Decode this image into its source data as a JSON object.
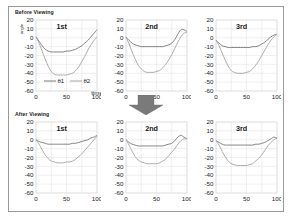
{
  "figure": {
    "sections": [
      {
        "title": "Before Viewing"
      },
      {
        "title": "After Viewing"
      }
    ],
    "arrow": {
      "name": "down-arrow",
      "color": "#7a7a7a"
    }
  },
  "axis": {
    "y_ticks": [
      "20",
      "10",
      "0",
      "-10",
      "-20",
      "-30",
      "-40",
      "-50",
      "-60"
    ],
    "x_ticks": [
      "0",
      "50",
      "100"
    ],
    "x_label": "time",
    "y_label": "angle",
    "ylim": [
      -60,
      20
    ],
    "xlim": [
      0,
      100
    ]
  },
  "legend": {
    "entries": [
      {
        "label": "θ1",
        "color": "#6e6e6e"
      },
      {
        "label": "θ2",
        "color": "#9d9d9d"
      }
    ]
  },
  "chart_data": {
    "type": "line",
    "xlabel": "time",
    "ylabel": "angle",
    "xlim": [
      0,
      100
    ],
    "ylim": [
      -60,
      20
    ],
    "grid": true,
    "legend_position": "inside-bottom-left (first panel only)",
    "y_ticks": [
      20,
      10,
      0,
      -10,
      -20,
      -30,
      -40,
      -50,
      -60
    ],
    "x_ticks": [
      0,
      50,
      100
    ],
    "panels": [
      {
        "row": "Before Viewing",
        "title": "1st",
        "x": [
          0,
          5,
          10,
          15,
          20,
          25,
          30,
          35,
          40,
          45,
          50,
          55,
          60,
          65,
          70,
          75,
          80,
          85,
          90,
          95,
          100
        ],
        "series": [
          {
            "name": "θ1",
            "values": [
              1,
              -4,
              -9,
              -13,
              -15,
              -16,
              -16,
              -16,
              -16,
              -16,
              -15,
              -15,
              -14,
              -13,
              -11,
              -9,
              -6,
              -3,
              1,
              5,
              9
            ]
          },
          {
            "name": "θ2",
            "values": [
              1,
              -6,
              -15,
              -24,
              -32,
              -38,
              -41,
              -42,
              -42,
              -42,
              -42,
              -41,
              -40,
              -37,
              -33,
              -27,
              -21,
              -14,
              -8,
              -3,
              1
            ]
          }
        ]
      },
      {
        "row": "Before Viewing",
        "title": "2nd",
        "x": [
          0,
          5,
          10,
          15,
          20,
          25,
          30,
          35,
          40,
          45,
          50,
          55,
          60,
          65,
          70,
          75,
          80,
          85,
          90,
          95,
          100
        ],
        "series": [
          {
            "name": "θ1",
            "values": [
              1,
              -3,
              -6,
              -8,
              -9,
              -10,
              -10,
              -10,
              -10,
              -10,
              -10,
              -10,
              -10,
              -9,
              -8,
              -6,
              -2,
              4,
              9,
              9,
              7
            ]
          },
          {
            "name": "θ2",
            "values": [
              1,
              -7,
              -16,
              -24,
              -31,
              -35,
              -38,
              -39,
              -39,
              -39,
              -38,
              -37,
              -34,
              -30,
              -25,
              -19,
              -12,
              -5,
              1,
              5,
              6
            ]
          }
        ]
      },
      {
        "row": "Before Viewing",
        "title": "3rd",
        "x": [
          0,
          5,
          10,
          15,
          20,
          25,
          30,
          35,
          40,
          45,
          50,
          55,
          60,
          65,
          70,
          75,
          80,
          85,
          90,
          95,
          100
        ],
        "series": [
          {
            "name": "θ1",
            "values": [
              -3,
              -6,
              -9,
              -10,
              -11,
              -11,
              -11,
              -11,
              -11,
              -11,
              -11,
              -11,
              -10,
              -10,
              -9,
              -7,
              -5,
              -2,
              1,
              3,
              4
            ]
          },
          {
            "name": "θ2",
            "values": [
              -3,
              -9,
              -17,
              -25,
              -32,
              -37,
              -39,
              -40,
              -40,
              -40,
              -39,
              -38,
              -35,
              -31,
              -26,
              -20,
              -14,
              -8,
              -3,
              1,
              4
            ]
          }
        ]
      },
      {
        "row": "After Viewing",
        "title": "1st",
        "x": [
          0,
          5,
          10,
          15,
          20,
          25,
          30,
          35,
          40,
          45,
          50,
          55,
          60,
          65,
          70,
          75,
          80,
          85,
          90,
          95,
          100
        ],
        "series": [
          {
            "name": "θ1",
            "values": [
              0,
              -2,
              -3,
              -4,
              -5,
              -5,
              -5,
              -5,
              -5,
              -5,
              -5,
              -5,
              -4,
              -4,
              -3,
              -2,
              -1,
              0,
              2,
              3,
              5
            ]
          },
          {
            "name": "θ2",
            "values": [
              0,
              -5,
              -11,
              -17,
              -21,
              -24,
              -25,
              -26,
              -26,
              -26,
              -25,
              -25,
              -24,
              -22,
              -19,
              -16,
              -12,
              -8,
              -4,
              0,
              4
            ]
          }
        ]
      },
      {
        "row": "After Viewing",
        "title": "2nd",
        "x": [
          0,
          5,
          10,
          15,
          20,
          25,
          30,
          35,
          40,
          45,
          50,
          55,
          60,
          65,
          70,
          75,
          80,
          85,
          90,
          95,
          100
        ],
        "series": [
          {
            "name": "θ1",
            "values": [
              0,
              -3,
              -5,
              -6,
              -7,
              -7,
              -7,
              -7,
              -7,
              -7,
              -7,
              -7,
              -7,
              -6,
              -5,
              -4,
              -1,
              3,
              5,
              3,
              1
            ]
          },
          {
            "name": "θ2",
            "values": [
              0,
              -6,
              -13,
              -19,
              -23,
              -25,
              -26,
              -27,
              -27,
              -27,
              -27,
              -26,
              -24,
              -22,
              -18,
              -14,
              -10,
              -5,
              -1,
              1,
              1
            ]
          }
        ]
      },
      {
        "row": "After Viewing",
        "title": "3rd",
        "x": [
          0,
          5,
          10,
          15,
          20,
          25,
          30,
          35,
          40,
          45,
          50,
          55,
          60,
          65,
          70,
          75,
          80,
          85,
          90,
          95,
          100
        ],
        "series": [
          {
            "name": "θ1",
            "values": [
              -1,
              -3,
              -5,
              -6,
              -6,
              -6,
              -6,
              -6,
              -6,
              -6,
              -6,
              -6,
              -6,
              -5,
              -5,
              -4,
              -3,
              -1,
              1,
              3,
              1
            ]
          },
          {
            "name": "θ2",
            "values": [
              -1,
              -6,
              -13,
              -19,
              -24,
              -27,
              -28,
              -29,
              -29,
              -29,
              -29,
              -28,
              -27,
              -24,
              -21,
              -17,
              -12,
              -7,
              -3,
              0,
              3
            ]
          }
        ]
      }
    ]
  }
}
